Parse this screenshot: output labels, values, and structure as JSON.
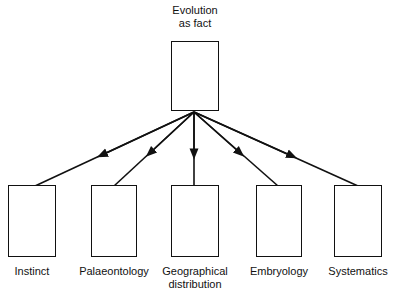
{
  "root": {
    "label_line1": "Evolution",
    "label_line2": "as fact"
  },
  "children": [
    {
      "label_line1": "Instinct",
      "label_line2": ""
    },
    {
      "label_line1": "Palaeontology",
      "label_line2": ""
    },
    {
      "label_line1": "Geographical",
      "label_line2": "distribution"
    },
    {
      "label_line1": "Embryology",
      "label_line2": ""
    },
    {
      "label_line1": "Systematics",
      "label_line2": ""
    }
  ],
  "colors": {
    "stroke": "#111111",
    "background": "#ffffff"
  }
}
